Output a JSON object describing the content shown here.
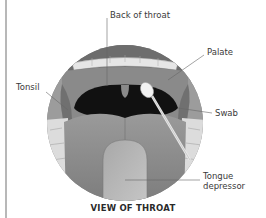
{
  "figure": {
    "title": "VIEW OF THROAT",
    "labels": {
      "back_of_throat": "Back of throat",
      "palate": "Palate",
      "tonsil": "Tonsil",
      "swab": "Swab",
      "tongue_depressor_line1": "Tongue",
      "tongue_depressor_line2": "depressor"
    }
  }
}
